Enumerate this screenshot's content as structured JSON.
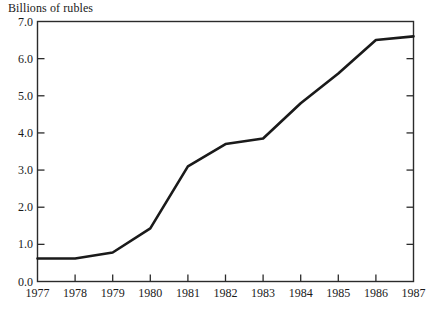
{
  "figure": {
    "axis_title": "Billions of rubles",
    "background_color": "#ffffff",
    "line_color": "#1a1a1a",
    "frame_color": "#2b2b2b"
  },
  "chart_data": {
    "type": "line",
    "title": "",
    "subtitle": "",
    "xlabel": "",
    "ylabel": "Billions of rubles",
    "categories": [
      "1977",
      "1978",
      "1979",
      "1980",
      "1981",
      "1982",
      "1983",
      "1984",
      "1985",
      "1986",
      "1987"
    ],
    "x": [
      1977,
      1978,
      1979,
      1980,
      1981,
      1982,
      1983,
      1984,
      1985,
      1986,
      1987
    ],
    "values": [
      0.62,
      0.62,
      0.78,
      1.43,
      3.1,
      3.7,
      3.85,
      4.8,
      5.6,
      6.5,
      6.6
    ],
    "series": [
      {
        "name": "Billions of rubles",
        "values": [
          0.62,
          0.62,
          0.78,
          1.43,
          3.1,
          3.7,
          3.85,
          4.8,
          5.6,
          6.5,
          6.6
        ]
      }
    ],
    "xlim": [
      1977,
      1987
    ],
    "ylim": [
      0.0,
      7.0
    ],
    "ytick_labels": [
      "0.0",
      "1.0",
      "2.0",
      "3.0",
      "4.0",
      "5.0",
      "6.0",
      "7.0"
    ],
    "ytick_values": [
      0.0,
      1.0,
      2.0,
      3.0,
      4.0,
      5.0,
      6.0,
      7.0
    ],
    "xtick_labels": [
      "1977",
      "1978",
      "1979",
      "1980",
      "1981",
      "1982",
      "1983",
      "1984",
      "1985",
      "1986",
      "1987"
    ],
    "xtick_values": [
      1977,
      1978,
      1979,
      1980,
      1981,
      1982,
      1983,
      1984,
      1985,
      1986,
      1987
    ],
    "grid": false,
    "legend": false,
    "legend_position": "none",
    "annotations": []
  }
}
